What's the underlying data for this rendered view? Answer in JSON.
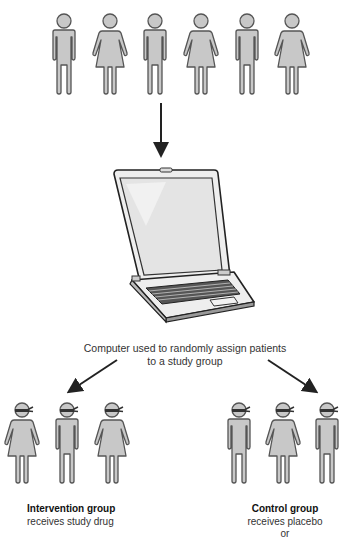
{
  "diagram": {
    "type": "randomized-trial-flow",
    "top_population": {
      "figures": [
        "male",
        "female",
        "male",
        "female",
        "male",
        "female"
      ]
    },
    "computer": {
      "icon": "laptop-icon",
      "caption_line1": "Computer used to randomly assign patients",
      "caption_line2": "to a study group"
    },
    "groups": [
      {
        "id": "intervention",
        "title": "Intervention group",
        "description": "receives study drug",
        "figures": [
          "female",
          "male",
          "female"
        ],
        "blindfolded": true
      },
      {
        "id": "control",
        "title": "Control group",
        "description": "receives placebo",
        "extra": "or",
        "figures": [
          "male",
          "female",
          "male"
        ],
        "blindfolded": true
      }
    ],
    "colors": {
      "figure_fill": "#c8c8c8",
      "figure_stroke": "#555555",
      "arrow": "#222222",
      "blindfold": "#333333"
    }
  }
}
